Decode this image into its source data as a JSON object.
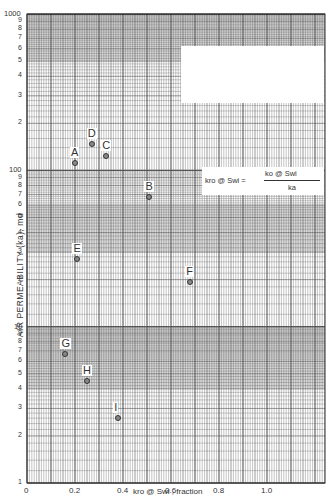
{
  "chart_data": {
    "type": "scatter",
    "title": "",
    "xlabel": "kro @ Swi , fraction",
    "ylabel": "AIR PERMEABILITY (ka), md",
    "xscale": "linear",
    "yscale": "log",
    "xlim": [
      0,
      1.24
    ],
    "ylim": [
      1,
      1000
    ],
    "x_ticks": [
      "0",
      "0.2",
      "0.4",
      "0.6",
      "0.8",
      "1.0"
    ],
    "y_ticks": [
      "1",
      "2",
      "3",
      "4",
      "5",
      "6",
      "7",
      "8",
      "9",
      "10",
      "2",
      "3",
      "4",
      "5",
      "6",
      "7",
      "8",
      "9",
      "100",
      "2",
      "3",
      "4",
      "5",
      "6",
      "7",
      "8",
      "9",
      "1000"
    ],
    "grid": true,
    "legend": null,
    "annotation": {
      "lhs": "kro @ Swi",
      "equals": "=",
      "numerator": "ko @ Swi",
      "denominator": "ka"
    },
    "points": [
      {
        "label": "A",
        "x": 0.2,
        "y": 111
      },
      {
        "label": "B",
        "x": 0.51,
        "y": 68
      },
      {
        "label": "C",
        "x": 0.33,
        "y": 124
      },
      {
        "label": "D",
        "x": 0.27,
        "y": 148
      },
      {
        "label": "E",
        "x": 0.21,
        "y": 27
      },
      {
        "label": "F",
        "x": 0.68,
        "y": 19.4
      },
      {
        "label": "G",
        "x": 0.16,
        "y": 6.7
      },
      {
        "label": "H",
        "x": 0.25,
        "y": 4.5
      },
      {
        "label": "I",
        "x": 0.38,
        "y": 2.6
      }
    ]
  },
  "axes": {
    "ytitle": "AIR PERMEABILITY (ka), md",
    "xtitle": "kro @ Swi , fraction",
    "xticks": [
      {
        "label": "0",
        "value": 0
      },
      {
        "label": "0.2",
        "value": 0.2
      },
      {
        "label": "0.4",
        "value": 0.4
      },
      {
        "label": "0.6",
        "value": 0.6
      },
      {
        "label": "0.8",
        "value": 0.8
      },
      {
        "label": "1.0",
        "value": 1.0
      }
    ],
    "yticks": [
      {
        "label": "1",
        "value": 1
      },
      {
        "label": "2",
        "value": 2
      },
      {
        "label": "3",
        "value": 3
      },
      {
        "label": "4",
        "value": 4
      },
      {
        "label": "5",
        "value": 5
      },
      {
        "label": "6",
        "value": 6
      },
      {
        "label": "7",
        "value": 7
      },
      {
        "label": "8",
        "value": 8
      },
      {
        "label": "9",
        "value": 9
      },
      {
        "label": "10",
        "value": 10
      },
      {
        "label": "2",
        "value": 20
      },
      {
        "label": "3",
        "value": 30
      },
      {
        "label": "4",
        "value": 40
      },
      {
        "label": "5",
        "value": 50
      },
      {
        "label": "6",
        "value": 60
      },
      {
        "label": "7",
        "value": 70
      },
      {
        "label": "8",
        "value": 80
      },
      {
        "label": "9",
        "value": 90
      },
      {
        "label": "100",
        "value": 100
      },
      {
        "label": "2",
        "value": 200
      },
      {
        "label": "3",
        "value": 300
      },
      {
        "label": "4",
        "value": 400
      },
      {
        "label": "5",
        "value": 500
      },
      {
        "label": "6",
        "value": 600
      },
      {
        "label": "7",
        "value": 700
      },
      {
        "label": "8",
        "value": 800
      },
      {
        "label": "9",
        "value": 900
      },
      {
        "label": "1000",
        "value": 1000
      }
    ]
  },
  "formula": {
    "lhs": "kro @ Swi  =",
    "numerator": "ko @ Swi",
    "denominator": "ka"
  },
  "colors": {
    "grid": "#555555",
    "shade": "#bdbdbd",
    "background": "#ffffff"
  }
}
